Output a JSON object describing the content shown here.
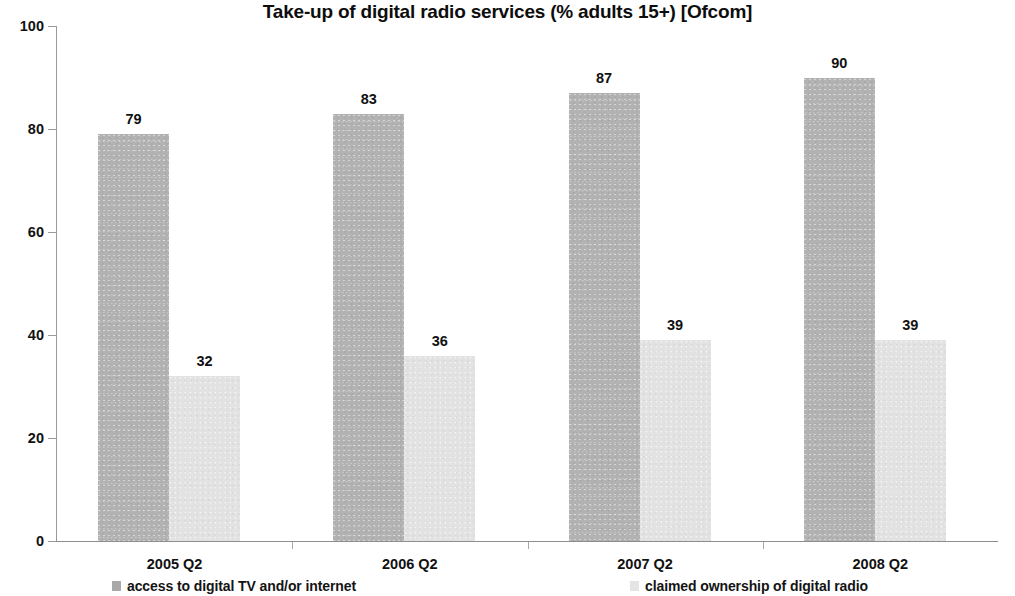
{
  "chart_data": {
    "type": "bar",
    "title": "Take-up of digital radio services (% adults 15+) [Ofcom]",
    "xlabel": "",
    "ylabel": "",
    "categories": [
      "2005 Q2",
      "2006 Q2",
      "2007 Q2",
      "2008 Q2"
    ],
    "series": [
      {
        "name": "access to digital TV and/or internet",
        "values": [
          79,
          83,
          87,
          90
        ],
        "color": "#b2b2b2"
      },
      {
        "name": "claimed ownership of digital radio",
        "values": [
          32,
          36,
          39,
          39
        ],
        "color": "#e2e2e2"
      }
    ],
    "ylim": [
      0,
      100
    ],
    "y_ticks": [
      "0",
      "20",
      "40",
      "60",
      "80",
      "100"
    ],
    "grid": false,
    "legend_position": "bottom"
  },
  "axis": {
    "y_tick_labels": [
      "0",
      "20",
      "40",
      "60",
      "80",
      "100"
    ]
  },
  "legend": {
    "entries": [
      {
        "label": "access to digital TV and/or internet"
      },
      {
        "label": "claimed ownership of digital radio"
      }
    ]
  }
}
